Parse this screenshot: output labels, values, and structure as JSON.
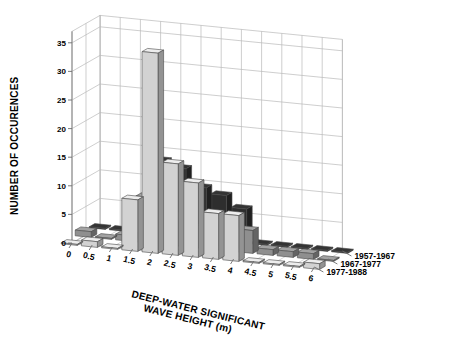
{
  "chart_data": {
    "type": "bar",
    "subtype": "3d-grouped-bar",
    "title": "",
    "xlabel": "DEEP-WATER SIGNIFICANT WAVE HEIGHT (m)",
    "ylabel": "NUMBER OF OCCURENCES",
    "zlabel": "",
    "ylim": [
      0,
      37
    ],
    "yticks": [
      0,
      5,
      10,
      15,
      20,
      25,
      30,
      35
    ],
    "xticks": [
      "0",
      "0.5",
      "1",
      "1.5",
      "2",
      "2.5",
      "3",
      "3.5",
      "4",
      "4.5",
      "5",
      "5.5",
      "6"
    ],
    "categories": [
      "0",
      "0.5",
      "1",
      "1.5",
      "2",
      "2.5",
      "3",
      "3.5",
      "4",
      "4.5",
      "5",
      "5.5",
      "6"
    ],
    "grid": true,
    "legend_position": "right-floor",
    "series": [
      {
        "name": "1977-1988",
        "color": "#d2d2d2",
        "values": [
          0,
          1,
          0,
          9,
          35,
          16,
          13,
          8,
          8,
          0,
          0,
          0,
          1
        ]
      },
      {
        "name": "1967-1977",
        "color": "#8f8f8f",
        "values": [
          1,
          0,
          1,
          8,
          9,
          6,
          4,
          6,
          4,
          1,
          1,
          1,
          0
        ]
      },
      {
        "name": "1957-1967",
        "color": "#2e2e2e",
        "values": [
          0,
          0,
          2,
          13,
          12,
          9,
          8,
          6,
          0,
          0,
          0,
          0,
          0
        ]
      }
    ]
  },
  "axes": {
    "y_title": "NUMBER OF OCCURENCES",
    "x_title_line1": "DEEP-WATER SIGNIFICANT",
    "x_title_line2": "WAVE HEIGHT (m)"
  },
  "legend": {
    "items": [
      {
        "label": "1977-1988"
      },
      {
        "label": "1967-1977"
      },
      {
        "label": "1957-1967"
      }
    ]
  },
  "colors": {
    "back_series": "#d2d2d2",
    "mid_series": "#8f8f8f",
    "front_series": "#2e2e2e",
    "grid": "#b9b9b9",
    "background": "#ffffff"
  }
}
